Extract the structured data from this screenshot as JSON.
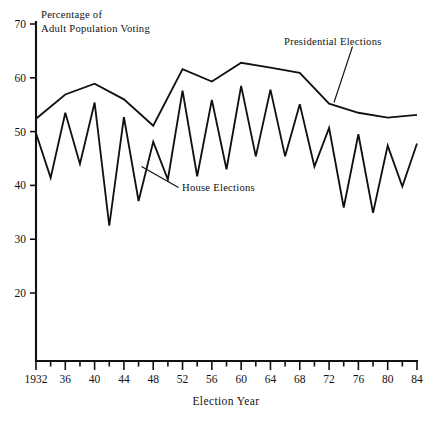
{
  "chart_data": {
    "type": "line",
    "title": "",
    "note": "Percentage of Adult Population Voting",
    "note_line1": "Percentage of",
    "note_line2": "Adult Population Voting",
    "xlabel": "Election Year",
    "ylabel": "",
    "xlim": [
      1932,
      1984
    ],
    "ylim": [
      20,
      70
    ],
    "y_axis_extends_below_min": true,
    "grid": false,
    "legend": "inline-annotations",
    "yticks": [
      20,
      30,
      40,
      50,
      60,
      70
    ],
    "ytick_labels": [
      "20",
      "30",
      "40",
      "50",
      "60",
      "70"
    ],
    "xticks": [
      1932,
      1934,
      1936,
      1938,
      1940,
      1942,
      1944,
      1946,
      1948,
      1950,
      1952,
      1954,
      1956,
      1958,
      1960,
      1962,
      1964,
      1966,
      1968,
      1970,
      1972,
      1974,
      1976,
      1978,
      1980,
      1982,
      1984
    ],
    "xtick_labels": [
      "1932",
      "",
      "36",
      "",
      "40",
      "",
      "44",
      "",
      "48",
      "",
      "52",
      "",
      "56",
      "",
      "60",
      "",
      "64",
      "",
      "68",
      "",
      "72",
      "",
      "76",
      "",
      "80",
      "",
      "84"
    ],
    "annotations": [
      {
        "text": "Presidential Elections",
        "points_to_series": "Presidential Elections"
      },
      {
        "text": "House Elections",
        "points_to_series": "House Elections"
      }
    ],
    "series": [
      {
        "name": "Presidential Elections",
        "x": [
          1932,
          1936,
          1940,
          1944,
          1948,
          1952,
          1956,
          1960,
          1964,
          1968,
          1972,
          1976,
          1980,
          1984
        ],
        "values": [
          52.4,
          56.9,
          58.9,
          56.0,
          51.1,
          61.6,
          59.3,
          62.8,
          61.9,
          60.9,
          55.2,
          53.5,
          52.6,
          53.1
        ]
      },
      {
        "name": "House Elections",
        "x": [
          1932,
          1934,
          1936,
          1938,
          1940,
          1942,
          1944,
          1946,
          1948,
          1950,
          1952,
          1954,
          1956,
          1958,
          1960,
          1962,
          1964,
          1966,
          1968,
          1970,
          1972,
          1974,
          1976,
          1978,
          1980,
          1982,
          1984
        ],
        "values": [
          49.7,
          41.4,
          53.5,
          44.0,
          55.4,
          32.5,
          52.7,
          37.1,
          48.1,
          41.1,
          57.6,
          41.7,
          55.9,
          43.0,
          58.5,
          45.4,
          57.8,
          45.4,
          55.1,
          43.5,
          50.7,
          35.9,
          49.5,
          34.9,
          47.4,
          39.8,
          47.8
        ]
      }
    ]
  },
  "axis": {
    "x_title": "Election Year"
  }
}
